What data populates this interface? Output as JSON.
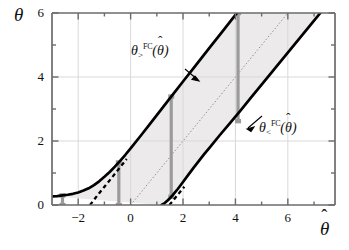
{
  "figure": {
    "kind": "confidence-belt-plot",
    "background": "#ffffff",
    "band_fill": "#eceaea",
    "curve_color": "#000000",
    "marker_color": "#9b9b9b",
    "grid_color": "#d8d8d8",
    "axis_color": "#6b6b6b"
  },
  "axes": {
    "ylabel": "θ",
    "xlabel": "θ",
    "xlabel_hat": "ˆ",
    "ylabel_hat": "",
    "x_ticks_major": [
      -2,
      0,
      2,
      4,
      6
    ],
    "x_ticks_major_labels": [
      "−2",
      "0",
      "2",
      "4",
      "6"
    ],
    "x_ticks_minor": [
      -3,
      -1,
      1,
      3,
      5,
      7
    ],
    "y_ticks_major": [
      0,
      2,
      4,
      6
    ],
    "y_ticks_major_labels": [
      "0",
      "2",
      "4",
      "6"
    ],
    "y_ticks_minor": [
      1,
      3,
      5
    ],
    "xlim": [
      -3.0,
      7.8
    ],
    "ylim": [
      0,
      6
    ],
    "grid": true
  },
  "curves": {
    "upper": {
      "label_theta": "θ",
      "label_sup": "FC",
      "label_sub": ">",
      "label_arg_open": "(",
      "label_arg_theta": "θ",
      "label_arg_hat": "ˆ",
      "label_arg_close": ")",
      "label_text": "θ>^FC(θ̂)"
    },
    "lower": {
      "label_theta": "θ",
      "label_sup": "FC",
      "label_sub": "<",
      "label_arg_open": "(",
      "label_arg_theta": "θ",
      "label_arg_hat": "ˆ",
      "label_arg_close": ")",
      "label_text": "θ<^FC(θ̂)"
    }
  },
  "chart_data": {
    "type": "line",
    "title": "",
    "xlabel": "θ̂",
    "ylabel": "θ",
    "xlim": [
      -3.0,
      7.8
    ],
    "ylim": [
      0,
      6
    ],
    "grid": true,
    "legend": "none",
    "series": [
      {
        "name": "theta_upper_FC",
        "style": "solid-thick",
        "color": "#000000",
        "points": [
          [
            -3.0,
            0.27
          ],
          [
            -2.8,
            0.28
          ],
          [
            -2.6,
            0.3
          ],
          [
            -2.4,
            0.32
          ],
          [
            -2.2,
            0.35
          ],
          [
            -2.0,
            0.39
          ],
          [
            -1.8,
            0.45
          ],
          [
            -1.6,
            0.52
          ],
          [
            -1.4,
            0.62
          ],
          [
            -1.2,
            0.74
          ],
          [
            -1.0,
            0.88
          ],
          [
            -0.8,
            1.03
          ],
          [
            -0.6,
            1.2
          ],
          [
            -0.4,
            1.38
          ],
          [
            -0.2,
            1.57
          ],
          [
            0.0,
            1.77
          ],
          [
            0.4,
            2.18
          ],
          [
            0.8,
            2.6
          ],
          [
            1.2,
            3.02
          ],
          [
            1.6,
            3.44
          ],
          [
            2.0,
            3.86
          ],
          [
            2.5,
            4.38
          ],
          [
            3.0,
            4.9
          ],
          [
            3.5,
            5.42
          ],
          [
            4.0,
            5.94
          ],
          [
            4.06,
            6.0
          ]
        ]
      },
      {
        "name": "theta_lower_FC",
        "style": "solid-thick",
        "color": "#000000",
        "points": [
          [
            1.18,
            0.0
          ],
          [
            1.3,
            0.06
          ],
          [
            1.4,
            0.13
          ],
          [
            1.5,
            0.21
          ],
          [
            1.6,
            0.3
          ],
          [
            1.7,
            0.4
          ],
          [
            1.8,
            0.5
          ],
          [
            1.9,
            0.61
          ],
          [
            2.0,
            0.72
          ],
          [
            2.2,
            0.94
          ],
          [
            2.4,
            1.16
          ],
          [
            2.6,
            1.37
          ],
          [
            2.8,
            1.58
          ],
          [
            3.0,
            1.78
          ],
          [
            3.4,
            2.18
          ],
          [
            3.8,
            2.57
          ],
          [
            4.2,
            2.96
          ],
          [
            4.6,
            3.36
          ],
          [
            5.0,
            3.76
          ],
          [
            5.5,
            4.26
          ],
          [
            6.0,
            4.76
          ],
          [
            6.5,
            5.26
          ],
          [
            7.0,
            5.76
          ],
          [
            7.24,
            6.0
          ]
        ]
      },
      {
        "name": "asymptote_upper_dashed",
        "style": "dashed",
        "color": "#000000",
        "points": [
          [
            -1.55,
            0.0
          ],
          [
            -1.2,
            0.37
          ],
          [
            -0.8,
            0.77
          ],
          [
            -0.4,
            1.18
          ],
          [
            -0.15,
            1.44
          ]
        ]
      },
      {
        "name": "asymptote_lower_dashed",
        "style": "dashed",
        "color": "#000000",
        "points": [
          [
            1.48,
            0.0
          ],
          [
            1.7,
            0.22
          ],
          [
            1.9,
            0.42
          ],
          [
            2.05,
            0.57
          ]
        ]
      },
      {
        "name": "identity_line",
        "style": "dotted",
        "color": "#8a8a8a",
        "points": [
          [
            0.0,
            0.0
          ],
          [
            6.0,
            6.0
          ]
        ]
      }
    ],
    "vertical_intervals": [
      {
        "x": -2.6,
        "y_low": 0.0,
        "y_high": 0.3,
        "color": "#9b9b9b"
      },
      {
        "x": -0.45,
        "y_low": 0.0,
        "y_high": 1.33,
        "color": "#9b9b9b"
      },
      {
        "x": 1.55,
        "y_low": 0.26,
        "y_high": 3.39,
        "color": "#9b9b9b"
      },
      {
        "x": 4.1,
        "y_low": 2.62,
        "y_high": 6.0,
        "color": "#9b9b9b"
      }
    ],
    "shaded_band": {
      "description": "region between theta_lower_FC and theta_upper_FC",
      "fill": "#eceaea"
    },
    "annotations": [
      {
        "text": "θ>^FC(θ̂)",
        "x": -0.1,
        "y": 4.85,
        "arrow_to": [
          0.95,
          4.05
        ]
      },
      {
        "text": "θ<^FC(θ̂)",
        "x": 5.05,
        "y": 2.45,
        "arrow_to": [
          4.35,
          2.92
        ]
      }
    ]
  }
}
